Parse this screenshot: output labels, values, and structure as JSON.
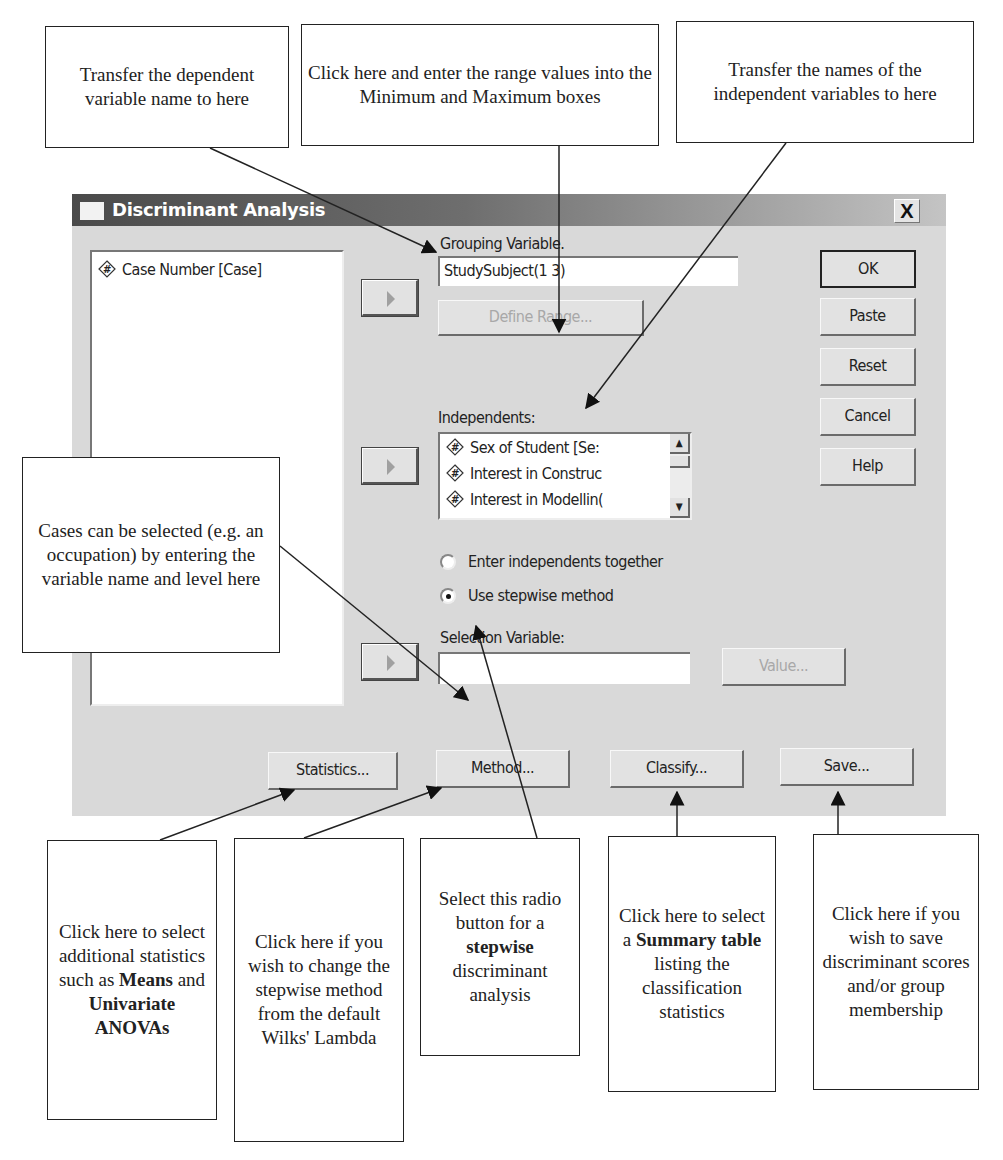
{
  "dialog": {
    "title": "Discriminant Analysis",
    "close_label": "X",
    "source_list": [
      {
        "icon": "numeric-variable-icon",
        "label": "Case Number [Case]"
      }
    ],
    "grouping_variable": {
      "label": "Grouping Variable.",
      "value": "StudySubject(1 3)",
      "define_range_label": "Define Range..."
    },
    "independents": {
      "label": "Independents:",
      "items": [
        {
          "icon": "numeric-variable-icon",
          "label": "Sex of Student [Se:"
        },
        {
          "icon": "numeric-variable-icon",
          "label": "Interest in Construc"
        },
        {
          "icon": "numeric-variable-icon",
          "label": "Interest in Modellin("
        }
      ]
    },
    "method_options": [
      {
        "label": "Enter independents together",
        "selected": false
      },
      {
        "label": "Use stepwise method",
        "selected": true
      }
    ],
    "selection_variable": {
      "label": "Selection Variable:",
      "value": "",
      "value_button_label": "Value..."
    },
    "side_buttons": [
      "OK",
      "Paste",
      "Reset",
      "Cancel",
      "Help"
    ],
    "bottom_buttons": [
      "Statistics...",
      "Method...",
      "Classify...",
      "Save..."
    ]
  },
  "callouts": {
    "dependent": "Transfer the dependent variable name to here",
    "range": "Click here and enter the range values into the Minimum and Maximum boxes",
    "independents": "Transfer the names of the independent variables to here",
    "cases": "Cases can be selected (e.g. an occupation) by entering the variable name and level here",
    "statistics": {
      "pre": "Click here to select additional statistics such as",
      "bold1": "Means",
      "mid": "and",
      "bold2": "Univariate ANOVAs"
    },
    "method": "Click here if you wish to change the stepwise method from the default Wilks' Lambda",
    "stepwise": {
      "pre": "Select this radio button for a",
      "bold": "stepwise",
      "post": "discriminant analysis"
    },
    "classify": {
      "pre": "Click here to select a",
      "bold": "Summary table",
      "post": "listing the classification statistics"
    },
    "save": "Click here if you wish to save discriminant scores and/or group membership"
  }
}
